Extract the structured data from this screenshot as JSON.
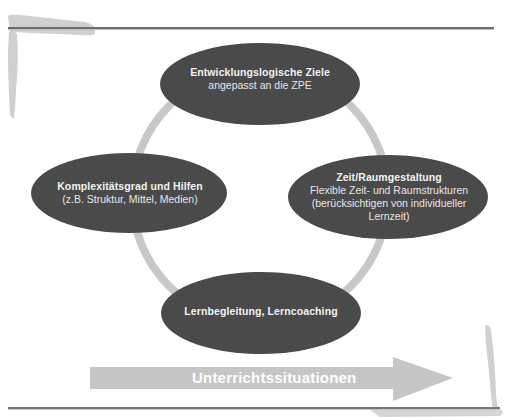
{
  "diagram": {
    "type": "cycle",
    "nodes": [
      {
        "id": "top",
        "title": "Entwicklungslogische Ziele",
        "lines": [
          "angepasst an die ZPE"
        ]
      },
      {
        "id": "left",
        "title": "Komplexitätsgrad und Hilfen",
        "lines": [
          "(z.B. Struktur, Mittel, Medien)"
        ]
      },
      {
        "id": "right",
        "title": "Zeit/Raumgestaltung",
        "lines": [
          "Flexible Zeit- und Raumstrukturen",
          "(berücksichtigen von individueller",
          "Lernzeit)"
        ]
      },
      {
        "id": "bottom",
        "title": "Lernbegleitung, Lerncoaching",
        "lines": []
      }
    ],
    "arrow": {
      "label": "Unterrichtssituationen",
      "direction": "right"
    }
  },
  "colors": {
    "ellipse": "#4a4a4a",
    "ring": "#c8c8c8",
    "arrow": "#c6c6c6",
    "rule": "#6e6e6e",
    "brush": "#cfcfcf",
    "text": "#e6e6e6"
  }
}
